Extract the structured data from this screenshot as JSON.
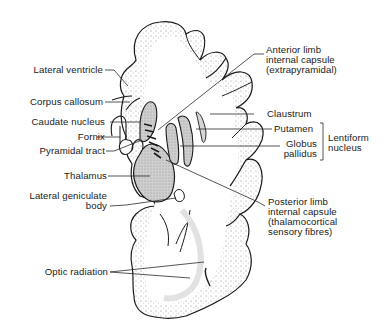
{
  "colors": {
    "line": "#1a1a1a",
    "shade": "#c8c8c8",
    "stipple": "#9a9a9a",
    "background": "#ffffff"
  },
  "labels": {
    "left": {
      "lateral_ventricle": "Lateral ventricle",
      "corpus_callosum": "Corpus callosum",
      "caudate_nucleus": "Caudate nucleus",
      "fornix": "Fornix",
      "pyramidal_tract": "Pyramidal tract",
      "thalamus": "Thalamus",
      "lateral_geniculate_1": "Lateral geniculate",
      "lateral_geniculate_2": "body",
      "optic_radiation": "Optic radiation"
    },
    "right": {
      "anterior_limb_1": "Anterior limb",
      "anterior_limb_2": "internal capsule",
      "anterior_limb_3": "(extrapyramidal)",
      "claustrum": "Claustrum",
      "putamen": "Putamen",
      "globus_1": "Globus",
      "globus_2": "pallidus",
      "lentiform_1": "Lentiform",
      "lentiform_2": "nucleus",
      "posterior_limb_1": "Posterior limb",
      "posterior_limb_2": "internal capsule",
      "posterior_limb_3": "(thalamocortical",
      "posterior_limb_4": "sensory fibres)"
    }
  }
}
